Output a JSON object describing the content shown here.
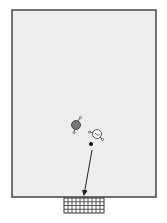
{
  "diagram": {
    "type": "sports-play-diagram",
    "colors": {
      "background": "#ffffff",
      "field_fill": "#eeeeee",
      "field_border": "#444444",
      "goal_net": "#333333",
      "attacker_fill": "#777777",
      "defender_fill": "#ffffff",
      "player_stroke": "#333333",
      "ball": "#111111",
      "arrow": "#222222"
    },
    "field": {
      "x": 12,
      "y": 10,
      "width": 144,
      "height": 187
    },
    "goal": {
      "x": 64,
      "y": 198,
      "width": 40,
      "height": 15,
      "cols": 10,
      "rows": 4
    },
    "players": [
      {
        "role": "attacker",
        "x": 76,
        "y": 125,
        "r": 4.5,
        "filled": true
      },
      {
        "role": "defender",
        "x": 97,
        "y": 134,
        "r": 4.5,
        "filled": false
      }
    ],
    "ball": {
      "x": 91,
      "y": 144,
      "r": 2
    },
    "pass_arrow": {
      "from": [
        92,
        150
      ],
      "to": [
        84,
        195
      ]
    }
  }
}
